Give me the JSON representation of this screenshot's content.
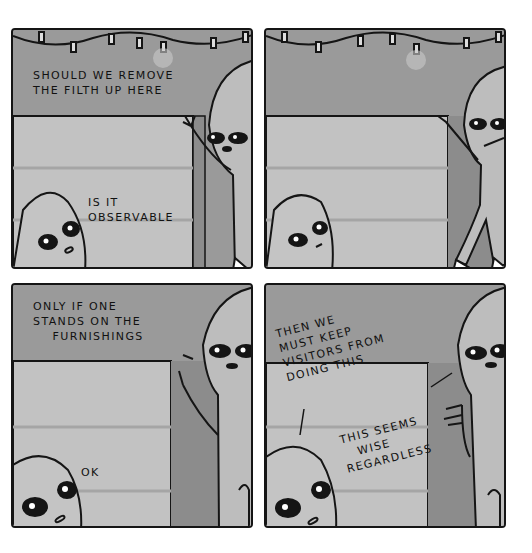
{
  "comic": {
    "colors": {
      "background": "#ffffff",
      "wall": "#9a9a9a",
      "wall_light": "#b8b8b8",
      "furniture": "#c2c2c2",
      "furniture_dark": "#8c8c8c",
      "alien_skin": "#bdbdbd",
      "outline": "#151515"
    },
    "panels": [
      {
        "id": 1,
        "captions": [
          {
            "speaker": "tall-alien",
            "text": "SHOULD WE REMOVE\nTHE FILTH UP HERE"
          },
          {
            "speaker": "short-alien",
            "text": "IS IT\nOBSERVABLE"
          }
        ]
      },
      {
        "id": 2,
        "captions": []
      },
      {
        "id": 3,
        "captions": [
          {
            "speaker": "tall-alien",
            "text": "ONLY IF ONE\nSTANDS ON THE\n    FURNISHINGS"
          },
          {
            "speaker": "short-alien",
            "text": "OK"
          }
        ]
      },
      {
        "id": 4,
        "captions": [
          {
            "speaker": "short-alien",
            "text": "THEN WE\nMUST KEEP\nVISITORS FROM\nDOING THIS"
          },
          {
            "speaker": "tall-alien",
            "text": "THIS SEEMS\n   WISE\nREGARDLESS"
          }
        ]
      }
    ]
  }
}
